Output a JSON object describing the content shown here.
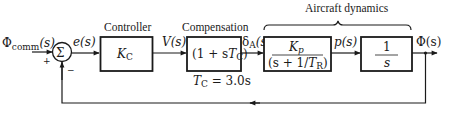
{
  "diagram": {
    "type": "control-system-block-diagram",
    "input": {
      "symbol": "Φ",
      "subscript": "comm",
      "arg": "(s)"
    },
    "summing_junction": {
      "symbol": "Σ",
      "plus_sign": "+",
      "minus_sign": "−"
    },
    "error_signal": {
      "label": "e(s)"
    },
    "controller": {
      "title": "Controller",
      "gain_symbol": "K",
      "gain_subscript": "C"
    },
    "controller_output": {
      "label": "V(s)"
    },
    "compensation": {
      "title": "Compensation",
      "tf_prefix": "(1 + s",
      "tf_T": "T",
      "tf_sub": "C",
      "tf_suffix": ")",
      "param_T": "T",
      "param_sub": "C",
      "param_value": " = 3.0s"
    },
    "aileron_signal": {
      "symbol": "δ",
      "subscript": "A",
      "arg": "(s)"
    },
    "aircraft_dynamics": {
      "title": "Aircraft dynamics",
      "roll_block": {
        "num_symbol": "K",
        "num_subscript": "p",
        "den_prefix": "(s + 1/",
        "den_T": "T",
        "den_sub": "R",
        "den_suffix": ")"
      },
      "roll_rate_signal": {
        "label": "p(s)"
      },
      "integrator_block": {
        "numerator": "1",
        "denominator": "s"
      }
    },
    "output": {
      "label": "Φ(s)"
    },
    "feedback": {
      "type": "unity negative feedback"
    },
    "colors": {
      "ink": "#1a1a1a",
      "background": "#ffffff"
    }
  }
}
